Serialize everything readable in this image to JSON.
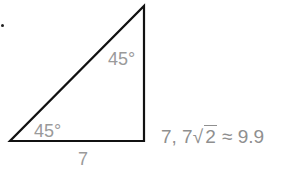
{
  "figure": {
    "type": "right isosceles triangle",
    "vertices": {
      "bottom_left": [
        10,
        141
      ],
      "bottom_right": [
        144,
        141
      ],
      "top_right": [
        144,
        6
      ]
    },
    "stroke_color": "#111111",
    "label_color": "#9a9a9a"
  },
  "labels": {
    "angle_top": "45°",
    "angle_bottom": "45°",
    "leg": "7",
    "side_prefix": "7, 7",
    "radicand": "2",
    "approx": " ≈ 9.9"
  }
}
